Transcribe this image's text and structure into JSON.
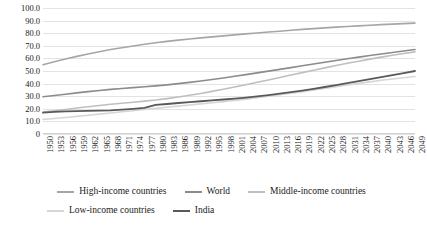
{
  "chart_data": {
    "type": "line",
    "title": "",
    "xlabel": "",
    "ylabel": "",
    "ylim": [
      0,
      100
    ],
    "ytick_labels": [
      "100.0",
      "90.0",
      "80.0",
      "70.0",
      "60.0",
      "50.0",
      "40.0",
      "30.0",
      "20.0",
      "10.0",
      "0"
    ],
    "ytick_values": [
      100,
      90,
      80,
      70,
      60,
      50,
      40,
      30,
      20,
      10,
      0
    ],
    "grid": true,
    "legend_position": "bottom",
    "x": [
      1950,
      1953,
      1956,
      1959,
      1962,
      1965,
      1968,
      1971,
      1974,
      1977,
      1980,
      1983,
      1986,
      1989,
      1992,
      1995,
      1998,
      2001,
      2004,
      2007,
      2010,
      2013,
      2016,
      2019,
      2022,
      2025,
      2028,
      2031,
      2034,
      2037,
      2040,
      2043,
      2046,
      2049
    ],
    "xtick_labels": [
      "1950",
      "1953",
      "1956",
      "1959",
      "1962",
      "1965",
      "1968",
      "1971",
      "1974",
      "1977",
      "1980",
      "1983",
      "1986",
      "1989",
      "1992",
      "1995",
      "1998",
      "2001",
      "2004",
      "2007",
      "2010",
      "2013",
      "2016",
      "2019",
      "2022",
      "2025",
      "2028",
      "2031",
      "2034",
      "2037",
      "2040",
      "2043",
      "2046",
      "2049"
    ],
    "series": [
      {
        "name": "High-income countries",
        "color": "#a6a6a6",
        "width": 1.6,
        "values": [
          55.0,
          57.3,
          59.5,
          61.6,
          63.5,
          65.3,
          67.0,
          68.5,
          69.9,
          71.2,
          72.4,
          73.5,
          74.5,
          75.4,
          76.3,
          77.1,
          77.9,
          78.7,
          79.5,
          80.2,
          80.9,
          81.6,
          82.3,
          83.0,
          83.6,
          84.2,
          84.8,
          85.3,
          85.8,
          86.3,
          86.8,
          87.2,
          87.6,
          88.0
        ]
      },
      {
        "name": "World",
        "color": "#8c8c8c",
        "width": 1.6,
        "values": [
          29.6,
          30.6,
          31.6,
          32.6,
          33.6,
          34.5,
          35.4,
          36.1,
          36.8,
          37.5,
          38.2,
          39.0,
          40.0,
          41.0,
          42.1,
          43.3,
          44.5,
          45.8,
          47.1,
          48.5,
          49.9,
          51.3,
          52.7,
          54.1,
          55.5,
          56.9,
          58.3,
          59.7,
          61.0,
          62.3,
          63.5,
          64.7,
          65.9,
          67.0
        ]
      },
      {
        "name": "Middle-income countries",
        "color": "#bfbfbf",
        "width": 1.6,
        "values": [
          17.5,
          18.5,
          19.5,
          20.6,
          21.6,
          22.6,
          23.6,
          24.4,
          25.2,
          26.1,
          27.0,
          28.1,
          29.3,
          30.7,
          32.2,
          33.8,
          35.5,
          37.3,
          39.1,
          41.0,
          42.9,
          44.8,
          46.8,
          48.7,
          50.6,
          52.5,
          54.3,
          56.1,
          57.8,
          59.4,
          61.0,
          62.5,
          63.9,
          65.2
        ]
      },
      {
        "name": "Low-income countries",
        "color": "#d6d6d6",
        "width": 1.6,
        "values": [
          11.5,
          12.3,
          13.1,
          14.0,
          14.9,
          15.8,
          16.7,
          17.6,
          18.5,
          19.4,
          20.3,
          21.2,
          22.1,
          23.0,
          23.9,
          24.8,
          25.7,
          26.7,
          27.7,
          28.8,
          29.9,
          31.1,
          32.3,
          33.6,
          34.9,
          36.2,
          37.6,
          38.9,
          40.2,
          41.4,
          42.6,
          43.7,
          44.7,
          45.6
        ]
      },
      {
        "name": "India",
        "color": "#595959",
        "width": 1.8,
        "values": [
          17.0,
          17.5,
          17.9,
          18.1,
          18.3,
          18.5,
          18.8,
          19.3,
          20.0,
          20.7,
          23.1,
          23.8,
          24.6,
          25.3,
          26.0,
          26.7,
          27.4,
          28.1,
          28.9,
          29.8,
          30.9,
          32.0,
          33.2,
          34.5,
          35.9,
          37.3,
          38.8,
          40.4,
          42.0,
          43.6,
          45.2,
          46.8,
          48.4,
          50.0
        ]
      }
    ]
  },
  "legend": {
    "rows": [
      [
        {
          "label": "High-income countries",
          "color": "#a6a6a6"
        },
        {
          "label": "World",
          "color": "#8c8c8c"
        },
        {
          "label": "Middle-income countries",
          "color": "#bfbfbf"
        }
      ],
      [
        {
          "label": "Low-income countries",
          "color": "#d6d6d6"
        },
        {
          "label": "India",
          "color": "#595959"
        }
      ]
    ]
  }
}
